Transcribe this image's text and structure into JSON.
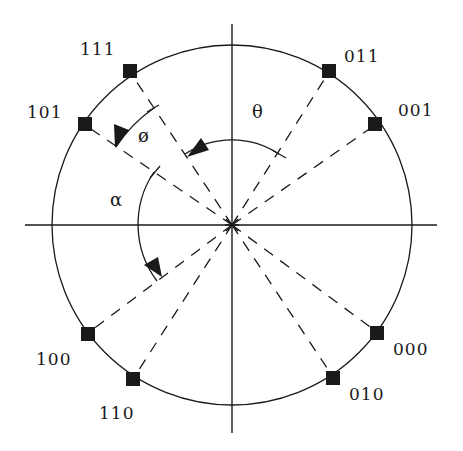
{
  "diagram": {
    "type": "8-PSK constellation (Gray-coded phase states)",
    "colors": {
      "ink": "#1a1a1a",
      "background": "#ffffff"
    },
    "center": [
      232,
      225
    ],
    "radius": 180,
    "axes": {
      "horizontal": true,
      "vertical": true
    },
    "points": [
      {
        "label": "011",
        "angle_from_vertical_deg": 33.7
      },
      {
        "label": "001",
        "angle_from_vertical_deg": 56.3
      },
      {
        "label": "000",
        "angle_from_vertical_deg": 123.7
      },
      {
        "label": "010",
        "angle_from_vertical_deg": 146.3
      },
      {
        "label": "110",
        "angle_from_vertical_deg": 213.7
      },
      {
        "label": "100",
        "angle_from_vertical_deg": 236.3
      },
      {
        "label": "101",
        "angle_from_vertical_deg": 303.7
      },
      {
        "label": "111",
        "angle_from_vertical_deg": 326.3
      }
    ],
    "angles": [
      {
        "symbol": "θ",
        "name": "theta",
        "from": "011",
        "to": "111"
      },
      {
        "symbol": "ø",
        "name": "phi",
        "from": "111",
        "to": "101"
      },
      {
        "symbol": "α",
        "name": "alpha",
        "from": "101",
        "to": "100"
      }
    ]
  },
  "labels": {
    "p111": "111",
    "p101": "101",
    "p011": "011",
    "p001": "001",
    "p100": "100",
    "p110": "110",
    "p000": "000",
    "p010": "010",
    "theta": "θ",
    "phi": "ø",
    "alpha": "α"
  }
}
